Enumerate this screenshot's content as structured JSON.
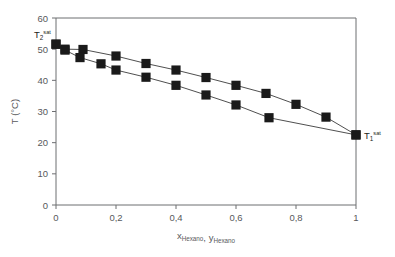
{
  "chart_data": {
    "type": "scatter",
    "title": "",
    "xlabel": "x_Hexano, y_Hexano",
    "ylabel": "T (°C)",
    "xlim": [
      0,
      1
    ],
    "ylim": [
      0,
      60
    ],
    "xticks": [
      "0",
      "0,2",
      "0,4",
      "0,6",
      "0,8",
      "1"
    ],
    "xtick_values": [
      0,
      0.2,
      0.4,
      0.6,
      0.8,
      1
    ],
    "yticks": [
      "0",
      "10",
      "20",
      "30",
      "40",
      "50",
      "60"
    ],
    "ytick_values": [
      0,
      10,
      20,
      30,
      40,
      50,
      60
    ],
    "grid": false,
    "legend": "none",
    "marker": "filled-square",
    "marker_color": "#1a1a1a",
    "line_color": "#3b3b3b",
    "series": [
      {
        "name": "Curva de rocio (y)",
        "x": [
          0.0,
          0.03,
          0.09,
          0.2,
          0.3,
          0.4,
          0.5,
          0.6,
          0.7,
          0.8,
          0.9,
          1.0
        ],
        "y": [
          51.6,
          50.0,
          49.9,
          47.8,
          45.4,
          43.3,
          40.9,
          38.4,
          35.8,
          32.3,
          28.2,
          22.5
        ]
      },
      {
        "name": "Curva de burbuja (x)",
        "x": [
          0.0,
          0.03,
          0.08,
          0.15,
          0.2,
          0.3,
          0.4,
          0.5,
          0.6,
          0.71,
          1.0
        ],
        "y": [
          51.6,
          49.7,
          47.3,
          45.3,
          43.3,
          41.0,
          38.4,
          35.3,
          32.1,
          28.0,
          22.5
        ]
      }
    ],
    "annotations": [
      {
        "name": "t2-sat",
        "base": "T",
        "sub": "2",
        "sup": "sat",
        "x": 0.0,
        "y": 55.0
      },
      {
        "name": "t1-sat",
        "base": "T",
        "sub": "1",
        "sup": "sat",
        "x": 1.0,
        "y": 22.5
      }
    ]
  }
}
